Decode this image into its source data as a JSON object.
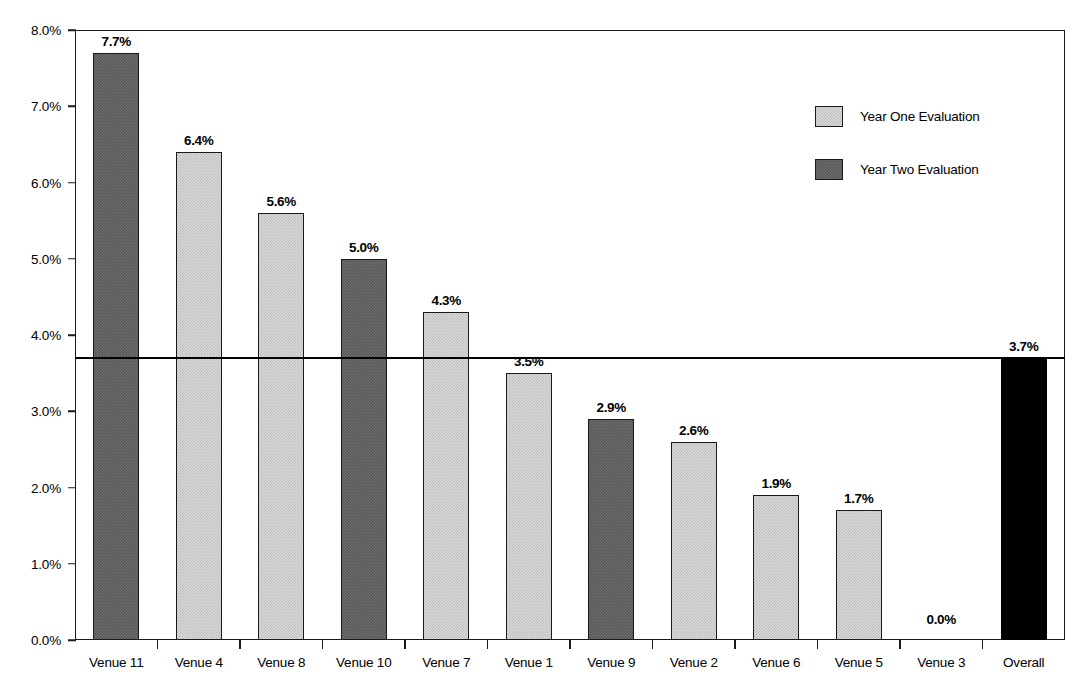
{
  "chart_data": {
    "type": "bar",
    "title": "",
    "subtitle": "",
    "xlabel": "",
    "ylabel": "",
    "ylim": [
      0,
      8
    ],
    "grid": false,
    "legend_position": "top-right",
    "categories": [
      "Venue 11",
      "Venue 4",
      "Venue 8",
      "Venue 10",
      "Venue 7",
      "Venue 1",
      "Venue 9",
      "Venue 2",
      "Venue 6",
      "Venue 5",
      "Venue 3",
      "Overall"
    ],
    "values": [
      7.7,
      6.4,
      5.6,
      5.0,
      4.3,
      3.5,
      2.9,
      2.6,
      1.9,
      1.7,
      0.0,
      3.7
    ],
    "data_labels": [
      "7.7%",
      "6.4%",
      "5.6%",
      "5.0%",
      "4.3%",
      "3.5%",
      "2.9%",
      "2.6%",
      "1.9%",
      "1.7%",
      "0.0%",
      "3.7%"
    ],
    "series_of_bar": [
      "Year Two Evaluation",
      "Year One Evaluation",
      "Year One Evaluation",
      "Year Two Evaluation",
      "Year One Evaluation",
      "Year One Evaluation",
      "Year Two Evaluation",
      "Year One Evaluation",
      "Year One Evaluation",
      "Year One Evaluation",
      "Year One Evaluation",
      "Overall"
    ],
    "bar_styles": [
      "dark",
      "light",
      "light",
      "dark",
      "light",
      "light",
      "dark",
      "light",
      "light",
      "light",
      "light",
      "black"
    ],
    "y_ticks": [
      "0.0%",
      "1.0%",
      "2.0%",
      "3.0%",
      "4.0%",
      "5.0%",
      "6.0%",
      "7.0%",
      "8.0%"
    ],
    "y_tick_values": [
      0,
      1,
      2,
      3,
      4,
      5,
      6,
      7,
      8
    ],
    "reference_line": {
      "value": 3.7,
      "label": "3.7%"
    },
    "legend": [
      {
        "label": "Year One Evaluation",
        "style": "light",
        "color": "#d9d9d9"
      },
      {
        "label": "Year Two Evaluation",
        "style": "dark",
        "color": "#595959"
      }
    ],
    "colors": {
      "light_bar": "#d9d9d9",
      "dark_bar": "#595959",
      "overall_bar": "#000000",
      "axis": "#1a1a1a",
      "reference_line": "#000000",
      "background": "#ffffff"
    }
  }
}
